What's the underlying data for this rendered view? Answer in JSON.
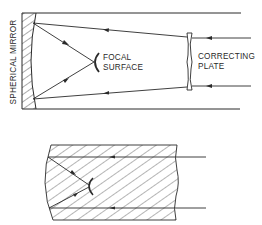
{
  "diagram": {
    "type": "schmidt-telescope-optics",
    "upper": {
      "labels": {
        "mirror": "SPHERICAL MIRROR",
        "focal_line1": "FOCAL",
        "focal_line2": "SURFACE",
        "plate_line1": "CORRECTING",
        "plate_line2": "PLATE"
      },
      "components": [
        "spherical-mirror",
        "focal-surface",
        "correcting-plate",
        "tube-walls",
        "light-rays"
      ]
    },
    "lower": {
      "description": "solid Schmidt camera (hatched glass block)",
      "components": [
        "glass-block",
        "curved-mirror-surface",
        "focal-surface",
        "light-rays"
      ]
    },
    "colors": {
      "line": "#2a2a2a",
      "background": "#ffffff"
    }
  }
}
